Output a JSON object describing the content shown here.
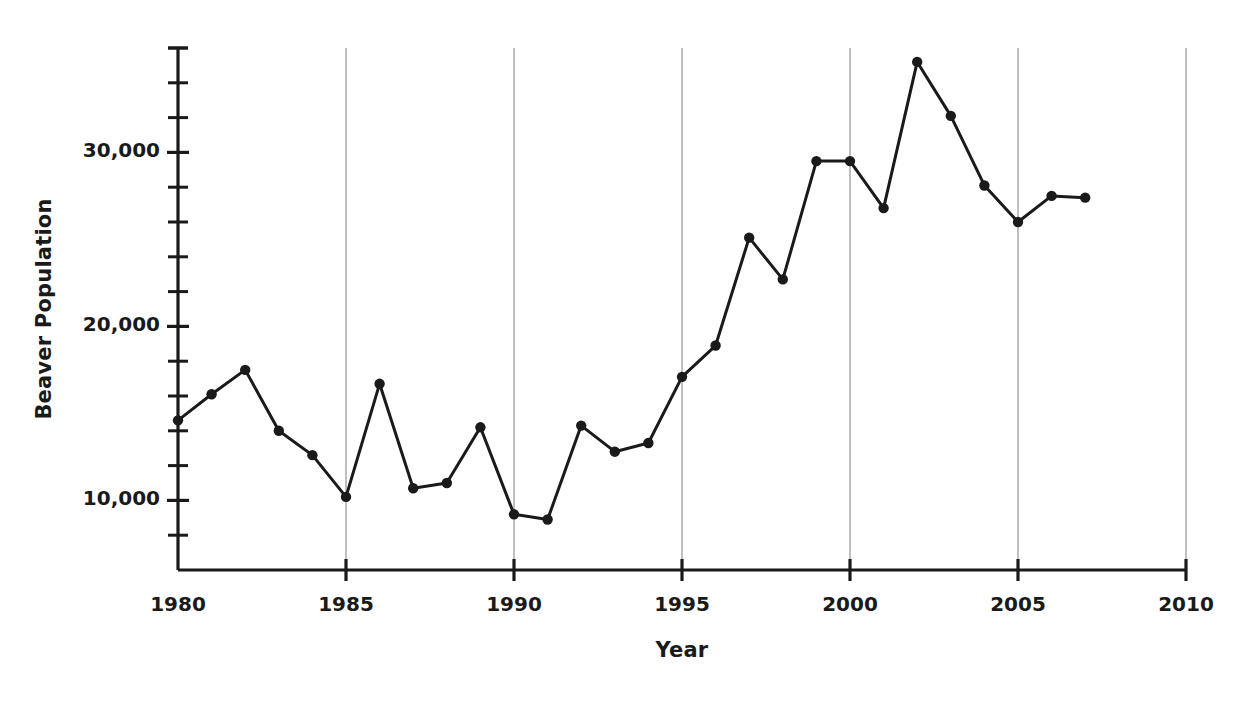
{
  "chart_data": {
    "type": "line",
    "title": "",
    "xlabel": "Year",
    "ylabel": "Beaver Population",
    "xlim": [
      1980,
      2010
    ],
    "ylim": [
      6000,
      36000
    ],
    "grid": "vertical-major-only",
    "legend": "none",
    "marker": "filled-circle",
    "line_color": "#1a1a1a",
    "grid_color": "#b0b0b0",
    "axis_color": "#1a1a1a",
    "x_major_ticks": [
      1980,
      1985,
      1990,
      1995,
      2000,
      2005,
      2010
    ],
    "x_tick_labels": [
      "1980",
      "1985",
      "1990",
      "1995",
      "2000",
      "2005",
      "2010"
    ],
    "y_major_ticks": [
      10000,
      20000,
      30000
    ],
    "y_tick_labels": [
      "10,000",
      "20,000",
      "30,000"
    ],
    "y_minor_tick_step": 2000,
    "y_minor_ticks": [
      8000,
      12000,
      14000,
      16000,
      18000,
      22000,
      24000,
      26000,
      28000,
      32000,
      34000,
      36000
    ],
    "x": [
      1980,
      1981,
      1982,
      1983,
      1984,
      1985,
      1986,
      1987,
      1988,
      1989,
      1990,
      1991,
      1992,
      1993,
      1994,
      1995,
      1996,
      1997,
      1998,
      1999,
      2000,
      2001,
      2002,
      2003,
      2004,
      2005,
      2006,
      2007
    ],
    "values": [
      14600,
      16100,
      17500,
      14000,
      12600,
      10200,
      16700,
      10700,
      11000,
      14200,
      9200,
      8900,
      14300,
      12800,
      13300,
      17100,
      18900,
      25100,
      22700,
      29500,
      29500,
      26800,
      35200,
      32100,
      28100,
      26000,
      27500,
      27400
    ]
  },
  "axis_titles": {
    "y": "Beaver Population",
    "x": "Year"
  }
}
